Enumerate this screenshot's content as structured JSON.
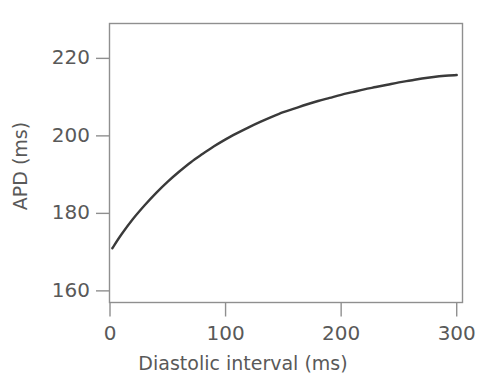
{
  "chart_data": {
    "type": "line",
    "title": "",
    "xlabel": "Diastolic interval (ms)",
    "ylabel": "APD (ms)",
    "xlim": [
      0,
      305
    ],
    "ylim": [
      157,
      229
    ],
    "xticks": [
      0,
      100,
      200,
      300
    ],
    "xticklabels": [
      "0",
      "100",
      "200",
      "300"
    ],
    "yticks": [
      160,
      180,
      200,
      220
    ],
    "yticklabels": [
      "160",
      "180",
      "200",
      "220"
    ],
    "grid": false,
    "legend": null,
    "frame": true,
    "series": [
      {
        "name": "APD restitution",
        "color": "#3a3a3a",
        "x": [
          2,
          10,
          20,
          30,
          40,
          50,
          60,
          70,
          80,
          90,
          100,
          110,
          120,
          130,
          140,
          150,
          160,
          170,
          180,
          190,
          200,
          210,
          220,
          230,
          240,
          250,
          260,
          270,
          280,
          290,
          300
        ],
        "y": [
          171.0,
          174.6,
          178.6,
          182.1,
          185.3,
          188.2,
          190.8,
          193.2,
          195.3,
          197.3,
          199.1,
          200.7,
          202.2,
          203.6,
          204.9,
          206.1,
          207.1,
          208.1,
          209.0,
          209.8,
          210.6,
          211.3,
          212.0,
          212.6,
          213.2,
          213.8,
          214.3,
          214.8,
          215.2,
          215.5,
          215.7
        ]
      }
    ]
  },
  "colors": {
    "axis": "#8f8f8f",
    "curve": "#3a3a3a",
    "text": "#595959",
    "background": "#ffffff"
  }
}
